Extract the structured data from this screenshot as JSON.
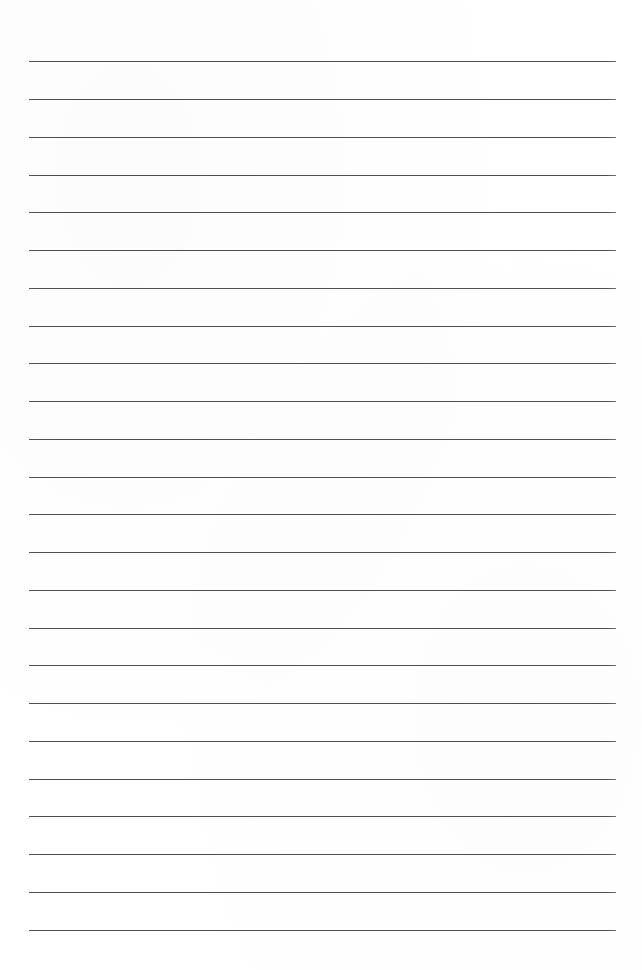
{
  "page": {
    "kind": "lined-paper-scan",
    "width": 642,
    "height": 970,
    "background_color": "#ffffff",
    "text_content": "",
    "handwriting_present": false
  },
  "rules": {
    "count": 24,
    "color": "#5a5a5a",
    "thickness_px": 1,
    "left_x": 29,
    "right_x": 616,
    "length_px": 587,
    "first_y": 61,
    "spacing_px": 37.8,
    "lines": [
      {
        "index": 1,
        "y": 61,
        "x1": 29,
        "x2": 616
      },
      {
        "index": 2,
        "y": 99,
        "x1": 29,
        "x2": 616
      },
      {
        "index": 3,
        "y": 137,
        "x1": 29,
        "x2": 616
      },
      {
        "index": 4,
        "y": 175,
        "x1": 29,
        "x2": 616
      },
      {
        "index": 5,
        "y": 212,
        "x1": 29,
        "x2": 616
      },
      {
        "index": 6,
        "y": 250,
        "x1": 29,
        "x2": 616
      },
      {
        "index": 7,
        "y": 288,
        "x1": 29,
        "x2": 616
      },
      {
        "index": 8,
        "y": 326,
        "x1": 29,
        "x2": 616
      },
      {
        "index": 9,
        "y": 363,
        "x1": 29,
        "x2": 616
      },
      {
        "index": 10,
        "y": 401,
        "x1": 29,
        "x2": 616
      },
      {
        "index": 11,
        "y": 439,
        "x1": 29,
        "x2": 616
      },
      {
        "index": 12,
        "y": 477,
        "x1": 29,
        "x2": 616
      },
      {
        "index": 13,
        "y": 514,
        "x1": 29,
        "x2": 616
      },
      {
        "index": 14,
        "y": 552,
        "x1": 29,
        "x2": 616
      },
      {
        "index": 15,
        "y": 590,
        "x1": 29,
        "x2": 616
      },
      {
        "index": 16,
        "y": 628,
        "x1": 29,
        "x2": 616
      },
      {
        "index": 17,
        "y": 665,
        "x1": 29,
        "x2": 616
      },
      {
        "index": 18,
        "y": 703,
        "x1": 29,
        "x2": 616
      },
      {
        "index": 19,
        "y": 741,
        "x1": 29,
        "x2": 616
      },
      {
        "index": 20,
        "y": 779,
        "x1": 29,
        "x2": 616
      },
      {
        "index": 21,
        "y": 816,
        "x1": 29,
        "x2": 616
      },
      {
        "index": 22,
        "y": 854,
        "x1": 29,
        "x2": 616
      },
      {
        "index": 23,
        "y": 892,
        "x1": 29,
        "x2": 616
      },
      {
        "index": 24,
        "y": 930,
        "x1": 29,
        "x2": 616
      }
    ]
  }
}
